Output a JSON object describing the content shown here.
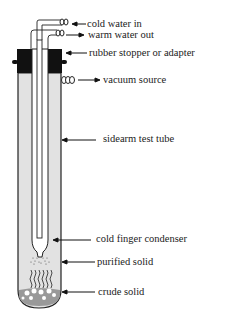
{
  "diagram": {
    "colors": {
      "tube_fill": "#e2e2e2",
      "stopper": "#111111",
      "line": "#222222"
    },
    "labels": [
      {
        "id": "cold-water-in",
        "text": "cold water in",
        "arrow": "pointing-left"
      },
      {
        "id": "warm-water-out",
        "text": "warm water out",
        "arrow": "pointing-right"
      },
      {
        "id": "rubber-stopper",
        "text": "rubber stopper or adapter",
        "arrow": "pointing-left"
      },
      {
        "id": "vacuum-source",
        "text": "vacuum source",
        "arrow": "pointing-right"
      },
      {
        "id": "sidearm-test-tube",
        "text": "sidearm test tube",
        "arrow": "pointing-left"
      },
      {
        "id": "cold-finger-condenser",
        "text": "cold finger condenser",
        "arrow": "pointing-left"
      },
      {
        "id": "purified-solid",
        "text": "purified solid",
        "arrow": "pointing-left"
      },
      {
        "id": "crude-solid",
        "text": "crude solid",
        "arrow": "pointing-left"
      }
    ]
  }
}
